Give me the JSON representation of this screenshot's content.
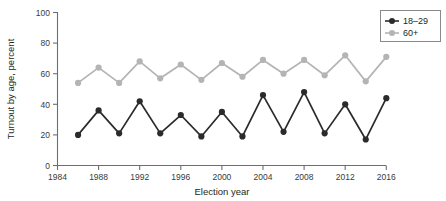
{
  "chart_data": {
    "type": "line",
    "title": "",
    "xlabel": "Election year",
    "ylabel": "Turnout by age, percent",
    "xlim": [
      1984,
      2016
    ],
    "ylim": [
      0,
      100
    ],
    "xticks": [
      1984,
      1988,
      1992,
      1996,
      2000,
      2004,
      2008,
      2012,
      2016
    ],
    "yticks": [
      0,
      20,
      40,
      60,
      80,
      100
    ],
    "grid": false,
    "legend_position": "top-right",
    "x": [
      1986,
      1988,
      1990,
      1992,
      1994,
      1996,
      1998,
      2000,
      2002,
      2004,
      2006,
      2008,
      2010,
      2012,
      2014,
      2016
    ],
    "series": [
      {
        "name": "18–29",
        "color": "#2b2b2b",
        "values": [
          20,
          36,
          21,
          42,
          21,
          33,
          19,
          35,
          19,
          46,
          22,
          48,
          21,
          40,
          17,
          44
        ]
      },
      {
        "name": "60+",
        "color": "#b4b4b4",
        "values": [
          54,
          64,
          54,
          68,
          57,
          66,
          56,
          67,
          58,
          69,
          60,
          69,
          59,
          72,
          55,
          71
        ]
      }
    ]
  },
  "legend": {
    "entries": [
      {
        "label": "18–29",
        "color": "#2b2b2b"
      },
      {
        "label": "60+",
        "color": "#b4b4b4"
      }
    ]
  },
  "axes": {
    "x_title": "Election year",
    "y_title": "Turnout by age, percent",
    "x_tick_labels": [
      "1984",
      "1988",
      "1992",
      "1996",
      "2000",
      "2004",
      "2008",
      "2012",
      "2016"
    ],
    "y_tick_labels": [
      "0",
      "20",
      "40",
      "60",
      "80",
      "100"
    ]
  },
  "colors": {
    "series_young": "#2b2b2b",
    "series_old": "#b4b4b4",
    "axis": "#6e6e6e",
    "text": "#231f20",
    "background": "#ffffff"
  }
}
